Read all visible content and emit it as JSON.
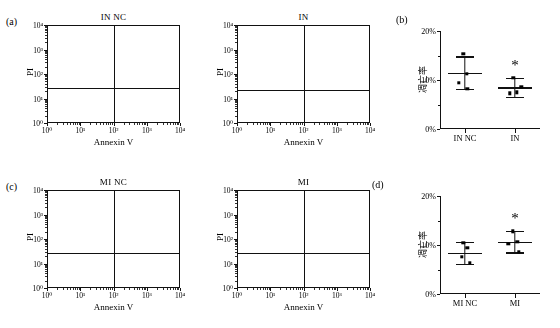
{
  "figure": {
    "panels": [
      "a",
      "b",
      "c",
      "d"
    ],
    "label_a": "(a)",
    "label_b": "(b)",
    "label_c": "(c)",
    "label_d": "(d)"
  },
  "flow_axes": {
    "x_label": "Annexin V",
    "y_label": "PI",
    "x_ticks": [
      "10⁰",
      "10¹",
      "10²",
      "10³",
      "10⁴"
    ],
    "y_ticks": [
      "10⁰",
      "10¹",
      "10²",
      "10³",
      "10⁴"
    ]
  },
  "flow_panels": [
    {
      "id": "flow-in-nc",
      "title": "IN NC",
      "panel_letter": "(a)",
      "quadrant_x_decade": 2.02,
      "quadrant_y_decade": 1.42,
      "clusters": [
        {
          "cx": 1.05,
          "cy": 0.45,
          "sx": 0.3,
          "sy": 0.3,
          "n": 2600,
          "rot": 0.55
        },
        {
          "cx": 2.35,
          "cy": 2.02,
          "sx": 0.45,
          "sy": 0.2,
          "n": 1700,
          "rot": 0.12
        },
        {
          "cx": 2.95,
          "cy": 2.2,
          "sx": 0.25,
          "sy": 0.3,
          "n": 700,
          "rot": 0.3
        },
        {
          "cx": 1.7,
          "cy": 0.95,
          "sx": 0.45,
          "sy": 0.38,
          "n": 500,
          "rot": 0.45
        }
      ]
    },
    {
      "id": "flow-in",
      "title": "IN",
      "panel_letter": "",
      "quadrant_x_decade": 2.02,
      "quadrant_y_decade": 1.36,
      "clusters": [
        {
          "cx": 1.1,
          "cy": 0.5,
          "sx": 0.34,
          "sy": 0.33,
          "n": 2700,
          "rot": 0.5
        },
        {
          "cx": 2.2,
          "cy": 2.0,
          "sx": 0.52,
          "sy": 0.24,
          "n": 1800,
          "rot": 0.18
        },
        {
          "cx": 2.8,
          "cy": 2.1,
          "sx": 0.28,
          "sy": 0.26,
          "n": 600,
          "rot": 0.25
        },
        {
          "cx": 1.75,
          "cy": 1.0,
          "sx": 0.45,
          "sy": 0.4,
          "n": 520,
          "rot": 0.42
        }
      ]
    },
    {
      "id": "flow-mi-nc",
      "title": "MI NC",
      "panel_letter": "(c)",
      "quadrant_x_decade": 2.02,
      "quadrant_y_decade": 1.42,
      "clusters": [
        {
          "cx": 1.15,
          "cy": 0.5,
          "sx": 0.4,
          "sy": 0.34,
          "n": 3200,
          "rot": 0.4
        },
        {
          "cx": 2.4,
          "cy": 2.05,
          "sx": 0.42,
          "sy": 0.2,
          "n": 1600,
          "rot": 0.1
        },
        {
          "cx": 2.9,
          "cy": 2.15,
          "sx": 0.25,
          "sy": 0.26,
          "n": 700,
          "rot": 0.22
        },
        {
          "cx": 1.7,
          "cy": 0.9,
          "sx": 0.48,
          "sy": 0.38,
          "n": 600,
          "rot": 0.45
        }
      ]
    },
    {
      "id": "flow-mi",
      "title": "MI",
      "panel_letter": "",
      "quadrant_x_decade": 2.02,
      "quadrant_y_decade": 1.42,
      "clusters": [
        {
          "cx": 1.1,
          "cy": 0.55,
          "sx": 0.36,
          "sy": 0.36,
          "n": 2800,
          "rot": 0.62
        },
        {
          "cx": 2.25,
          "cy": 2.02,
          "sx": 0.48,
          "sy": 0.24,
          "n": 1700,
          "rot": 0.14
        },
        {
          "cx": 2.85,
          "cy": 2.08,
          "sx": 0.26,
          "sy": 0.24,
          "n": 650,
          "rot": 0.2
        },
        {
          "cx": 1.85,
          "cy": 1.1,
          "sx": 0.5,
          "sy": 0.45,
          "n": 800,
          "rot": 0.55
        }
      ]
    }
  ],
  "chart_data": [
    {
      "id": "stat-b",
      "panel_letter": "(b)",
      "type": "scatter",
      "title": "",
      "ylabel": "凋亡率",
      "xlabel": "",
      "ylim": [
        0,
        20
      ],
      "yticks": [
        0,
        10,
        20
      ],
      "ytick_labels": [
        "0%",
        "10%",
        "20%"
      ],
      "yminor_ticks": [
        5,
        15
      ],
      "categories": [
        "IN NC",
        "IN"
      ],
      "groups": [
        {
          "name": "IN NC",
          "mean": 11.5,
          "sd": 3.3,
          "points": [
            15.4,
            11.3,
            9.4,
            8.2
          ],
          "significant": false
        },
        {
          "name": "IN",
          "mean": 8.5,
          "sd": 1.9,
          "points": [
            10.4,
            7.5,
            7.3,
            8.6
          ],
          "significant": true,
          "marker": "*"
        }
      ]
    },
    {
      "id": "stat-d",
      "panel_letter": "(d)",
      "type": "scatter",
      "title": "",
      "ylabel": "凋亡率",
      "xlabel": "",
      "ylim": [
        0,
        20
      ],
      "yticks": [
        0,
        10,
        20
      ],
      "ytick_labels": [
        "0%",
        "10%",
        "20%"
      ],
      "yminor_ticks": [
        5,
        15
      ],
      "categories": [
        "MI NC",
        "MI"
      ],
      "groups": [
        {
          "name": "MI NC",
          "mean": 8.4,
          "sd": 2.2,
          "points": [
            10.5,
            9.4,
            7.6,
            6.4
          ],
          "significant": false
        },
        {
          "name": "MI",
          "mean": 10.7,
          "sd": 2.2,
          "points": [
            12.8,
            10.6,
            10.2,
            8.6
          ],
          "significant": true,
          "marker": "*"
        }
      ]
    }
  ],
  "colors": {
    "dots": "#9a9a9a",
    "axis": "#111111",
    "marker": "#000000",
    "background": "#ffffff"
  }
}
